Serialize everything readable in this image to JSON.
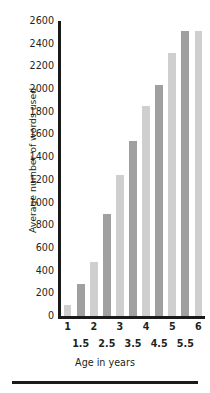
{
  "chart_data": {
    "type": "bar",
    "title": "",
    "xlabel": "Age in years",
    "ylabel": "Average number of words used",
    "categories": [
      "1",
      "1.5",
      "2",
      "2.5",
      "3",
      "3.5",
      "4",
      "4.5",
      "5",
      "5.5",
      "6"
    ],
    "values": [
      100,
      280,
      480,
      900,
      1240,
      1540,
      1850,
      2040,
      2320,
      2510,
      2510
    ],
    "ylim": [
      0,
      2600
    ],
    "ytick_step": 200,
    "yticks": [
      0,
      200,
      400,
      600,
      800,
      1000,
      1200,
      1400,
      1600,
      1800,
      2000,
      2200,
      2400,
      2600
    ],
    "ytick_labels": [
      "0",
      "200",
      "400",
      "600",
      "800",
      "1000",
      "1200",
      "1400",
      "1600",
      "1800",
      "2000",
      "2200",
      "2400",
      "2600"
    ],
    "xticks_major": [
      "1",
      "2",
      "3",
      "4",
      "5",
      "6"
    ],
    "xticks_minor": [
      "1.5",
      "2.5",
      "3.5",
      "4.5",
      "5.5"
    ],
    "grid": false,
    "legend": false,
    "bar_colors": [
      "#cfcfcf",
      "#a0a0a0",
      "#cfcfcf",
      "#a0a0a0",
      "#cfcfcf",
      "#a0a0a0",
      "#cfcfcf",
      "#a0a0a0",
      "#cfcfcf",
      "#a0a0a0",
      "#cfcfcf"
    ],
    "series": [
      {
        "name": "Average number of words used",
        "points": [
          {
            "age": "1",
            "value": 100
          },
          {
            "age": "1.5",
            "value": 280
          },
          {
            "age": "2",
            "value": 480
          },
          {
            "age": "2.5",
            "value": 900
          },
          {
            "age": "3",
            "value": 1240
          },
          {
            "age": "3.5",
            "value": 1540
          },
          {
            "age": "4",
            "value": 1850
          },
          {
            "age": "4.5",
            "value": 2040
          },
          {
            "age": "5",
            "value": 2320
          },
          {
            "age": "5.5",
            "value": 2510
          }
        ]
      }
    ]
  },
  "axis": {
    "axis_color": "#1a1a1a"
  }
}
